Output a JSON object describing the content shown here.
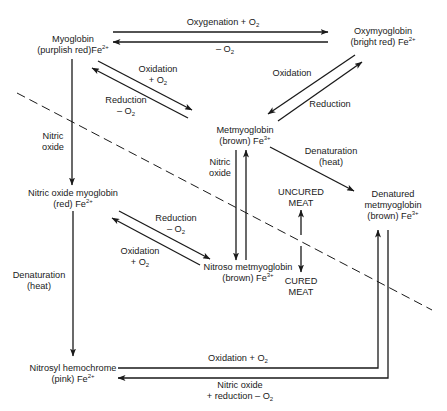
{
  "nodes": {
    "myoglobin": {
      "line1": "Myoglobin",
      "line2": "(purplish red)Fe",
      "charge": "2+"
    },
    "oxymyoglobin": {
      "line1": "Oxymyoglobin",
      "line2": "(bright red) Fe",
      "charge": "2+"
    },
    "metmyoglobin": {
      "line1": "Metmyoglobin",
      "line2": "(brown) Fe",
      "charge": "3+"
    },
    "nitric_oxide_myoglobin": {
      "line1": "Nitric oxide myoglobin",
      "line2": "(red) Fe",
      "charge": "2+"
    },
    "nitroso_metmyoglobin": {
      "line1": "Nitroso metmyoglobin",
      "line2": "(brown) Fe",
      "charge": "3+"
    },
    "denatured_metmyoglobin": {
      "line1": "Denatured",
      "line2": "metmyoglobin",
      "line3": "(brown) Fe",
      "charge": "3+"
    },
    "nitrosyl_hemochrome": {
      "line1": "Nitrosyl hemochrome",
      "line2": "(pink) Fe",
      "charge": "2+"
    },
    "uncured_meat": {
      "line1": "UNCURED",
      "line2": "MEAT"
    },
    "cured_meat": {
      "line1": "CURED",
      "line2": "MEAT"
    }
  },
  "edges": {
    "oxygenation": {
      "text": "Oxygenation + O",
      "sub": "2"
    },
    "deoxygenation": {
      "text": "– O",
      "sub": "2"
    },
    "oxidation_myo": {
      "line1": "Oxidation",
      "line2": "+ O",
      "sub": "2"
    },
    "reduction_myo": {
      "line1": "Reduction",
      "line2": "– O",
      "sub": "2"
    },
    "oxidation_oxy": {
      "text": "Oxidation"
    },
    "reduction_oxy": {
      "text": "Reduction"
    },
    "nitric_oxide_left": {
      "line1": "Nitric",
      "line2": "oxide"
    },
    "nitric_oxide_mid": {
      "line1": "Nitric",
      "line2": "oxide"
    },
    "denaturation_met": {
      "line1": "Denaturation",
      "line2": "(heat)"
    },
    "reduction_nom": {
      "line1": "Reduction",
      "line2": "– O",
      "sub": "2"
    },
    "oxidation_nom": {
      "line1": "Oxidation",
      "line2": "+ O",
      "sub": "2"
    },
    "denaturation_nom": {
      "line1": "Denaturation",
      "line2": "(heat)"
    },
    "oxidation_bottom": {
      "text": "Oxidation + O",
      "sub": "2"
    },
    "nitric_reduction_bottom": {
      "line1": "Nitric oxide",
      "line2": "+ reduction – O",
      "sub": "2"
    }
  },
  "colors": {
    "line": "#1a1a1a",
    "background": "#ffffff"
  }
}
